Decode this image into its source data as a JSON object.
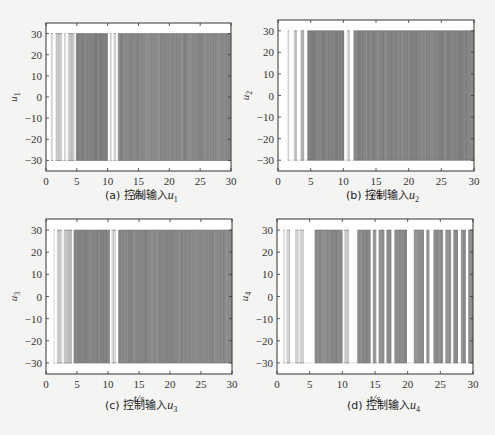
{
  "chart_data": [
    {
      "id": "a",
      "type": "line",
      "title": "",
      "caption_prefix": "(a) 控制输入",
      "caption_var": "u",
      "caption_sub": "1",
      "xlabel": "t/s",
      "ylabel": "u",
      "ylabel_sub": "1",
      "xlim": [
        0,
        30
      ],
      "ylim": [
        -35,
        35
      ],
      "xticks": [
        0,
        5,
        10,
        15,
        20,
        25,
        30
      ],
      "yticks": [
        30,
        20,
        10,
        0,
        -10,
        -20,
        -30
      ],
      "grid": false,
      "saturation": [
        -30,
        30
      ],
      "description": "Bang-bang switching control input saturating at ±30 with dense chattering",
      "bands": [
        {
          "x0": 0.8,
          "x1": 1.1,
          "density": 0.15
        },
        {
          "x0": 1.6,
          "x1": 2.6,
          "density": 0.25
        },
        {
          "x0": 3.0,
          "x1": 3.2,
          "density": 0.2
        },
        {
          "x0": 3.6,
          "x1": 4.6,
          "density": 0.3
        },
        {
          "x0": 4.9,
          "x1": 10.0,
          "density": 0.75
        },
        {
          "x0": 10.4,
          "x1": 10.6,
          "density": 0.2
        },
        {
          "x0": 11.0,
          "x1": 11.3,
          "density": 0.2
        },
        {
          "x0": 11.7,
          "x1": 30.0,
          "density": 0.7
        }
      ]
    },
    {
      "id": "b",
      "type": "line",
      "title": "",
      "caption_prefix": "(b) 控制输入",
      "caption_var": "u",
      "caption_sub": "2",
      "xlabel": "t/s",
      "ylabel": "u",
      "ylabel_sub": "2",
      "xlim": [
        0,
        30
      ],
      "ylim": [
        -35,
        35
      ],
      "xticks": [
        0,
        5,
        10,
        15,
        20,
        25,
        30
      ],
      "yticks": [
        30,
        20,
        10,
        0,
        -10,
        -20,
        -30
      ],
      "grid": false,
      "saturation": [
        -30,
        30
      ],
      "description": "Bang-bang switching control input saturating at ±30 with dense chattering",
      "bands": [
        {
          "x0": 1.5,
          "x1": 1.7,
          "density": 0.2
        },
        {
          "x0": 2.5,
          "x1": 2.9,
          "density": 0.25
        },
        {
          "x0": 3.5,
          "x1": 4.0,
          "density": 0.4
        },
        {
          "x0": 4.5,
          "x1": 10.1,
          "density": 0.75
        },
        {
          "x0": 10.6,
          "x1": 11.0,
          "density": 0.2
        },
        {
          "x0": 11.6,
          "x1": 30.0,
          "density": 0.72
        }
      ]
    },
    {
      "id": "c",
      "type": "line",
      "title": "",
      "caption_prefix": "(c) 控制输入",
      "caption_var": "u",
      "caption_sub": "3",
      "xlabel": "t/s",
      "ylabel": "u",
      "ylabel_sub": "3",
      "xlim": [
        0,
        30
      ],
      "ylim": [
        -35,
        35
      ],
      "xticks": [
        0,
        5,
        10,
        15,
        20,
        25,
        30
      ],
      "yticks": [
        30,
        20,
        10,
        0,
        -10,
        -20,
        -30
      ],
      "grid": false,
      "saturation": [
        -30,
        30
      ],
      "description": "Bang-bang switching control input saturating at ±30 with dense chattering",
      "bands": [
        {
          "x0": 1.2,
          "x1": 1.4,
          "density": 0.12
        },
        {
          "x0": 1.8,
          "x1": 2.6,
          "density": 0.25
        },
        {
          "x0": 2.9,
          "x1": 4.2,
          "density": 0.3
        },
        {
          "x0": 4.5,
          "x1": 10.3,
          "density": 0.75
        },
        {
          "x0": 10.6,
          "x1": 11.3,
          "density": 0.2
        },
        {
          "x0": 11.7,
          "x1": 30.0,
          "density": 0.7
        }
      ]
    },
    {
      "id": "d",
      "type": "line",
      "title": "",
      "caption_prefix": "(d) 控制输入",
      "caption_var": "u",
      "caption_sub": "4",
      "xlabel": "t/s",
      "ylabel": "u",
      "ylabel_sub": "4",
      "xlim": [
        0,
        30
      ],
      "ylim": [
        -35,
        35
      ],
      "xticks": [
        0,
        5,
        10,
        15,
        20,
        25,
        30
      ],
      "yticks": [
        30,
        20,
        10,
        0,
        -10,
        -20,
        -30
      ],
      "grid": false,
      "saturation": [
        -30,
        30
      ],
      "description": "Bang-bang switching control input with periodic chattering bursts saturating at ±30",
      "bands": [
        {
          "x0": 1.0,
          "x1": 1.2,
          "density": 0.15
        },
        {
          "x0": 1.5,
          "x1": 2.0,
          "density": 0.2
        },
        {
          "x0": 2.8,
          "x1": 3.3,
          "density": 0.2
        },
        {
          "x0": 3.5,
          "x1": 4.1,
          "density": 0.2
        },
        {
          "x0": 5.8,
          "x1": 10.0,
          "density": 0.7
        },
        {
          "x0": 10.3,
          "x1": 11.0,
          "density": 0.2
        },
        {
          "x0": 12.3,
          "x1": 14.3,
          "density": 0.7
        },
        {
          "x0": 14.7,
          "x1": 15.2,
          "density": 0.6
        },
        {
          "x0": 15.6,
          "x1": 16.4,
          "density": 0.65
        },
        {
          "x0": 16.8,
          "x1": 17.5,
          "density": 0.65
        },
        {
          "x0": 18.0,
          "x1": 19.9,
          "density": 0.7
        },
        {
          "x0": 21.0,
          "x1": 22.5,
          "density": 0.68
        },
        {
          "x0": 22.9,
          "x1": 23.3,
          "density": 0.6
        },
        {
          "x0": 24.0,
          "x1": 25.4,
          "density": 0.68
        },
        {
          "x0": 25.8,
          "x1": 26.6,
          "density": 0.65
        },
        {
          "x0": 27.0,
          "x1": 27.7,
          "density": 0.65
        },
        {
          "x0": 28.2,
          "x1": 28.9,
          "density": 0.65
        },
        {
          "x0": 29.3,
          "x1": 30.0,
          "density": 0.65
        }
      ]
    }
  ],
  "layout": {
    "panels": [
      {
        "left": 0,
        "top": 0,
        "plot": {
          "x": 46,
          "y": 23,
          "w": 185,
          "h": 148
        },
        "caption_x": 105,
        "caption_y": 194
      },
      {
        "left": 245,
        "top": 0,
        "plot": {
          "x": 33,
          "y": 20,
          "w": 196,
          "h": 151
        },
        "caption_x": 101,
        "caption_y": 194
      },
      {
        "left": 0,
        "top": 215,
        "plot": {
          "x": 46,
          "y": 4,
          "w": 186,
          "h": 155
        },
        "caption_x": 105,
        "caption_y": 189
      },
      {
        "left": 245,
        "top": 215,
        "plot": {
          "x": 32,
          "y": 4,
          "w": 196,
          "h": 155
        },
        "caption_x": 102,
        "caption_y": 189
      }
    ]
  },
  "colors": {
    "axis": "#333333",
    "signal_dark": "#6e6e6e",
    "signal_light": "#c8c8c8",
    "background": "#ffffff"
  }
}
